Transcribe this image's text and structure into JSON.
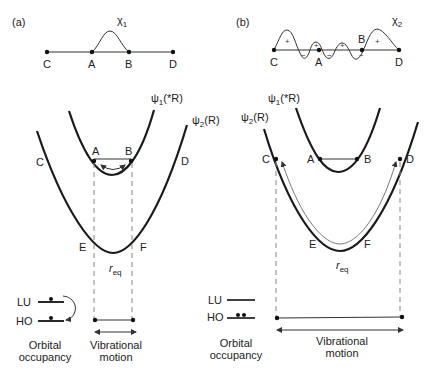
{
  "panels": {
    "a": {
      "label": "(a)",
      "chi_label": "χ",
      "chi_sub": "1",
      "points": {
        "C": "C",
        "A": "A",
        "B": "B",
        "D": "D"
      },
      "psi1_label": "ψ",
      "psi1_sub": "1",
      "psi1_arg": "(*R)",
      "psi2_label": "ψ",
      "psi2_sub": "2",
      "psi2_arg": "(R)",
      "curve_points": {
        "A": "A",
        "B": "B",
        "C": "C",
        "D": "D",
        "E": "E",
        "F": "F"
      },
      "req_main": "r",
      "req_sub": "eq",
      "orbital": {
        "lu": "LU",
        "ho": "HO",
        "caption_line1": "Orbital",
        "caption_line2": "occupancy"
      },
      "vibration": {
        "caption_line1": "Vibrational",
        "caption_line2": "motion"
      }
    },
    "b": {
      "label": "(b)",
      "chi_label": "χ",
      "chi_sub": "2",
      "points": {
        "C": "C",
        "A": "A",
        "B": "B",
        "D": "D"
      },
      "signs": [
        "+",
        "−",
        "+",
        "−",
        "+",
        "−",
        "+"
      ],
      "psi1_label": "ψ",
      "psi1_sub": "1",
      "psi1_arg": "(*R)",
      "psi2_label": "ψ",
      "psi2_sub": "2",
      "psi2_arg": "(R)",
      "curve_points": {
        "A": "A",
        "B": "B",
        "C": "C",
        "D": "D",
        "E": "E",
        "F": "F"
      },
      "req_main": "r",
      "req_sub": "eq",
      "orbital": {
        "lu": "LU",
        "ho": "HO",
        "caption_line1": "Orbital",
        "caption_line2": "occupancy"
      },
      "vibration": {
        "caption_line1": "Vibrational",
        "caption_line2": "motion"
      }
    }
  }
}
